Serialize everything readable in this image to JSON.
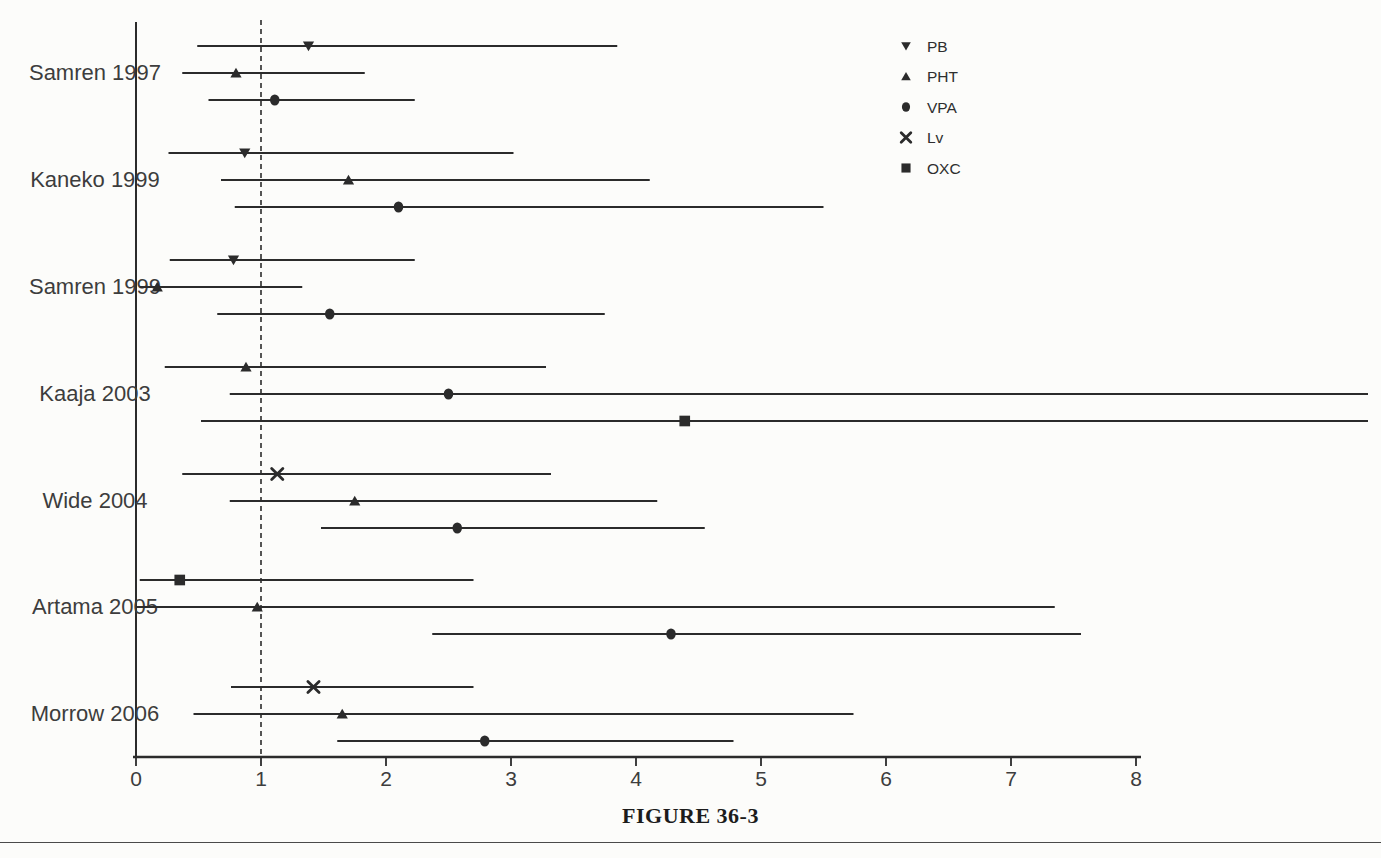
{
  "figure": {
    "caption": "FIGURE 36-3"
  },
  "colors": {
    "ink": "#2b2b2b",
    "background": "#fcfcfa",
    "label": "#3d3d3d"
  },
  "chart_data": {
    "type": "scatter",
    "subtype": "forest-plot",
    "title": "FIGURE 36-3",
    "xlabel": "",
    "ylabel": "",
    "xlim": [
      0,
      8
    ],
    "x_ticks": [
      0,
      1,
      2,
      3,
      4,
      5,
      6,
      7,
      8
    ],
    "grid": false,
    "reference_line_x": 1,
    "legend": {
      "position": "top-right",
      "entries": [
        {
          "label": "PB",
          "marker": "triangle-down"
        },
        {
          "label": "PHT",
          "marker": "triangle-up"
        },
        {
          "label": "VPA",
          "marker": "circle"
        },
        {
          "label": "Lv",
          "marker": "x"
        },
        {
          "label": "OXC",
          "marker": "square"
        }
      ]
    },
    "markers": {
      "PB": "triangle-down",
      "PHT": "triangle-up",
      "VPA": "circle",
      "Lv": "x",
      "OXC": "square"
    },
    "studies": [
      {
        "name": "Samren 1997",
        "rows": [
          {
            "drug": "PB",
            "est": 1.38,
            "lo": 0.49,
            "hi": 3.85
          },
          {
            "drug": "PHT",
            "est": 0.8,
            "lo": 0.37,
            "hi": 1.83
          },
          {
            "drug": "VPA",
            "est": 1.11,
            "lo": 0.58,
            "hi": 2.23
          }
        ]
      },
      {
        "name": "Kaneko 1999",
        "rows": [
          {
            "drug": "PB",
            "est": 0.87,
            "lo": 0.26,
            "hi": 3.02
          },
          {
            "drug": "PHT",
            "est": 1.7,
            "lo": 0.68,
            "hi": 4.11
          },
          {
            "drug": "VPA",
            "est": 2.1,
            "lo": 0.79,
            "hi": 5.5
          }
        ]
      },
      {
        "name": "Samren 1999",
        "rows": [
          {
            "drug": "PB",
            "est": 0.78,
            "lo": 0.27,
            "hi": 2.23
          },
          {
            "drug": "PHT",
            "est": 0.17,
            "lo": 0.03,
            "hi": 1.33
          },
          {
            "drug": "VPA",
            "est": 1.55,
            "lo": 0.65,
            "hi": 3.75
          }
        ]
      },
      {
        "name": "Kaaja 2003",
        "rows": [
          {
            "drug": "PHT",
            "est": 0.88,
            "lo": 0.23,
            "hi": 3.28
          },
          {
            "drug": "VPA",
            "est": 2.5,
            "lo": 0.75,
            "hi": 9.85,
            "clipped_right": true
          },
          {
            "drug": "OXC",
            "est": 4.39,
            "lo": 0.52,
            "hi": 9.85,
            "clipped_right": true
          }
        ]
      },
      {
        "name": "Wide 2004",
        "rows": [
          {
            "drug": "Lv",
            "est": 1.13,
            "lo": 0.37,
            "hi": 3.32
          },
          {
            "drug": "PHT",
            "est": 1.75,
            "lo": 0.75,
            "hi": 4.17
          },
          {
            "drug": "VPA",
            "est": 2.57,
            "lo": 1.48,
            "hi": 4.55
          }
        ]
      },
      {
        "name": "Artama 2005",
        "rows": [
          {
            "drug": "OXC",
            "est": 0.35,
            "lo": 0.03,
            "hi": 2.7
          },
          {
            "drug": "PHT",
            "est": 0.97,
            "lo": 0.0,
            "hi": 7.35
          },
          {
            "drug": "VPA",
            "est": 4.28,
            "lo": 2.37,
            "hi": 7.56
          }
        ]
      },
      {
        "name": "Morrow 2006",
        "rows": [
          {
            "drug": "Lv",
            "est": 1.42,
            "lo": 0.76,
            "hi": 2.7
          },
          {
            "drug": "PHT",
            "est": 1.65,
            "lo": 0.46,
            "hi": 5.74
          },
          {
            "drug": "VPA",
            "est": 2.79,
            "lo": 1.61,
            "hi": 4.78
          }
        ]
      }
    ]
  }
}
